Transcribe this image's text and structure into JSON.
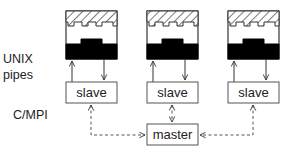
{
  "labels": {
    "layer_top_line1": "UNIX",
    "layer_top_line2": "pipes",
    "layer_bottom": "C/MPI"
  },
  "nodes": {
    "slaves": [
      {
        "label": "slave"
      },
      {
        "label": "slave"
      },
      {
        "label": "slave"
      }
    ],
    "master": {
      "label": "master"
    }
  },
  "processes": [
    {
      "icon": "process-chip-icon"
    },
    {
      "icon": "process-chip-icon"
    },
    {
      "icon": "process-chip-icon"
    }
  ],
  "edges": {
    "pipe_links": "solid bidirectional (up arrow from slave to process, down arrow from process to slave)",
    "mpi_links": "dashed bidirectional between each slave and master"
  },
  "colors": {
    "stroke": "#333333",
    "fill_dark": "#000000",
    "background": "#ffffff"
  }
}
